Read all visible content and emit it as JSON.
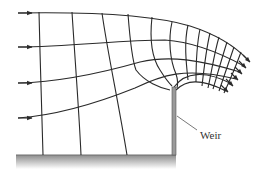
{
  "figure": {
    "type": "flow-net",
    "labels": {
      "weir": "Weir"
    },
    "colors": {
      "lines": "#2a2a2a",
      "weir_fill": "#9a9a9a",
      "ground_top": "#8c8c8c",
      "ground_bottom": "#ffffff",
      "background": "#ffffff"
    },
    "elements": {
      "inflow_arrows": 4,
      "outflow_arrows": 6,
      "streamlines": 6,
      "equipotential_lines": 13
    }
  }
}
